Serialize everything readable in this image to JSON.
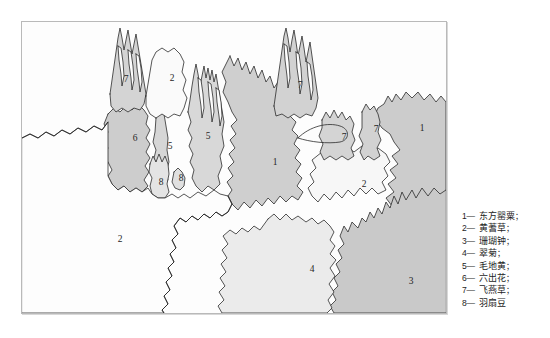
{
  "figure": {
    "type": "planting-plan-map",
    "background_color": "#ffffff"
  },
  "map": {
    "frame_border_color": "#b9b9b9",
    "base_color": "#fdfdfd",
    "outline_color": "#2b2b2b",
    "regions": [
      {
        "id": "r-7-topleft",
        "label": "7",
        "fill": "#d4d4d4",
        "label_x": 104,
        "label_y": 58
      },
      {
        "id": "r-2-top",
        "label": "2",
        "fill": "#fafafa",
        "label_x": 150,
        "label_y": 57
      },
      {
        "id": "r-6",
        "label": "6",
        "fill": "#cdcdcd",
        "label_x": 113,
        "label_y": 117
      },
      {
        "id": "r-5-left",
        "label": "5",
        "fill": "#d6d6d6",
        "label_x": 148,
        "label_y": 125
      },
      {
        "id": "r-5-mid",
        "label": "5",
        "fill": "#d8d8d8",
        "label_x": 186,
        "label_y": 115
      },
      {
        "id": "r-8-left",
        "label": "8",
        "fill": "#e4e4e4",
        "label_x": 139,
        "label_y": 161
      },
      {
        "id": "r-8-right",
        "label": "8",
        "fill": "#e0e0e0",
        "label_x": 159,
        "label_y": 157
      },
      {
        "id": "r-1-center",
        "label": "1",
        "fill": "#cfcfcf",
        "label_x": 253,
        "label_y": 141
      },
      {
        "id": "r-7-upper",
        "label": "7",
        "fill": "#d2d2d2",
        "label_x": 278,
        "label_y": 64
      },
      {
        "id": "r-7-small",
        "label": "7",
        "fill": "#d4d4d4",
        "label_x": 322,
        "label_y": 116
      },
      {
        "id": "r-7-narrow",
        "label": "7",
        "fill": "#d2d2d2",
        "label_x": 354,
        "label_y": 108
      },
      {
        "id": "r-1-right",
        "label": "1",
        "fill": "#cccccc",
        "label_x": 400,
        "label_y": 107
      },
      {
        "id": "r-2-right",
        "label": "2",
        "fill": "#f7f7f7",
        "label_x": 342,
        "label_y": 163
      },
      {
        "id": "r-2-lowerleft",
        "label": "2",
        "fill": "#fdfdfd",
        "label_x": 98,
        "label_y": 218
      },
      {
        "id": "r-4",
        "label": "4",
        "fill": "#ebebeb",
        "label_x": 290,
        "label_y": 248
      },
      {
        "id": "r-3",
        "label": "3",
        "fill": "#c9c9c9",
        "label_x": 389,
        "label_y": 260
      }
    ]
  },
  "legend": {
    "items": [
      {
        "key": "1",
        "dash": "—",
        "name": "东方罂粟",
        "sep": "；"
      },
      {
        "key": "2",
        "dash": "—",
        "name": "黄蓍草",
        "sep": "；"
      },
      {
        "key": "3",
        "dash": "—",
        "name": "珊瑚钟",
        "sep": "；"
      },
      {
        "key": "4",
        "dash": "—",
        "name": "翠菊",
        "sep": "；"
      },
      {
        "key": "5",
        "dash": "—",
        "name": "毛地黄",
        "sep": "；"
      },
      {
        "key": "6",
        "dash": "—",
        "name": "六出花",
        "sep": "；"
      },
      {
        "key": "7",
        "dash": "—",
        "name": "飞燕草",
        "sep": "；"
      },
      {
        "key": "8",
        "dash": "—",
        "name": "羽扇豆",
        "sep": ""
      }
    ]
  }
}
